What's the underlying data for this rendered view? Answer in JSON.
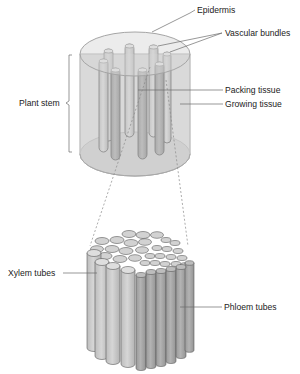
{
  "diagram": {
    "colors": {
      "stem_fill": "#d9d9d9",
      "stem_outline": "#a8a8a8",
      "tube_light": "#cfcfcf",
      "tube_dark": "#a9a9a9",
      "outline": "#555555",
      "leader_line": "#6b6b6b"
    },
    "labels": {
      "epidermis": "Epidermis",
      "vascular_bundles": "Vascular bundles",
      "plant_stem": "Plant stem",
      "packing_tissue": "Packing tissue",
      "growing_tissue": "Growing tissue",
      "xylem_tubes": "Xylem tubes",
      "phloem_tubes": "Phloem tubes"
    },
    "panels": [
      {
        "name": "stem-cylinder",
        "description": "Transparent stem cylinder containing vascular bundles"
      },
      {
        "name": "vascular-bundle-detail",
        "description": "Magnified bundle of xylem and phloem tubes"
      }
    ]
  }
}
